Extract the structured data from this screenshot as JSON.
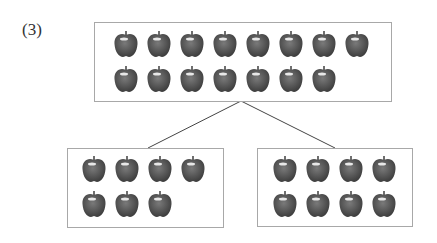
{
  "problem_label": "(3)",
  "diagram": {
    "whole": {
      "count": 15,
      "rows": [
        8,
        7
      ]
    },
    "parts": [
      {
        "count": 7,
        "rows": [
          4,
          3
        ]
      },
      {
        "count": 8,
        "rows": [
          4,
          4
        ]
      }
    ]
  },
  "colors": {
    "apple": "#5a5a5a",
    "box_border": "#a8a8a8",
    "line": "#444444"
  }
}
